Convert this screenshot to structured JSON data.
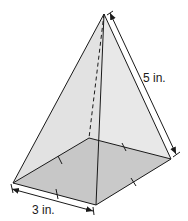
{
  "figure": {
    "type": "square pyramid",
    "labels": {
      "base_edge": "3 in.",
      "lateral_edge": "5 in."
    },
    "colors": {
      "face": "#e6e6e6",
      "base": "#b9b9b9",
      "stroke": "#1a1a1a"
    }
  }
}
